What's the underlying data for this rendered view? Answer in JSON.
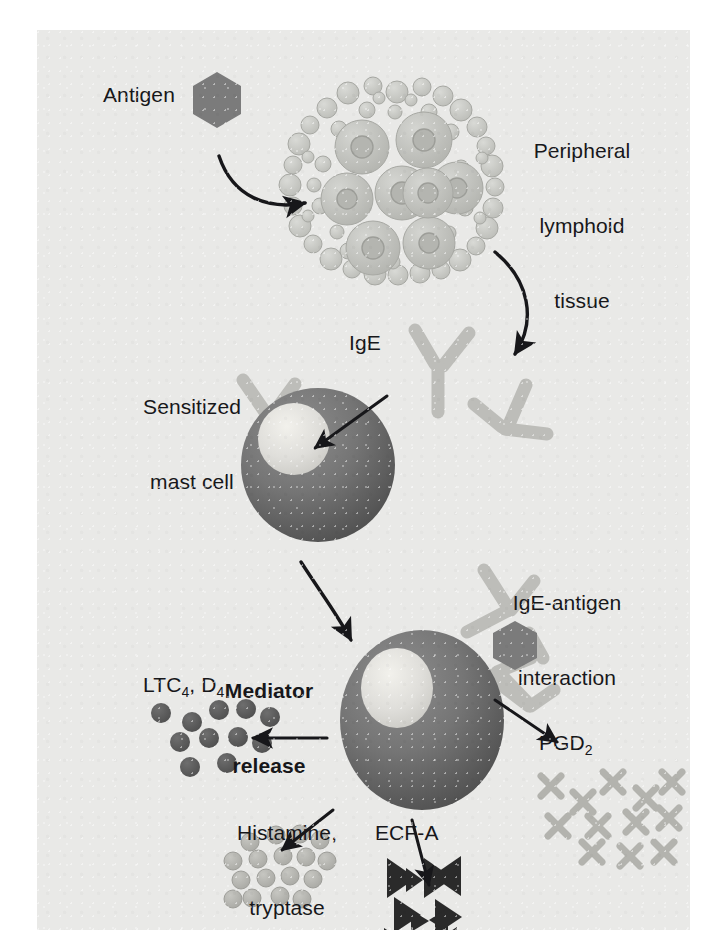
{
  "figure": {
    "type": "biological-pathway-diagram",
    "background_color": "#e9e9e7",
    "ink_color": "#17171a"
  },
  "labels": {
    "antigen": "Antigen",
    "peripheral_lymphoid_tissue_line1": "Peripheral",
    "peripheral_lymphoid_tissue_line2": "lymphoid",
    "peripheral_lymphoid_tissue_line3": "tissue",
    "ige": "IgE",
    "sensitized_mast_cell_line1": "Sensitized",
    "sensitized_mast_cell_line2": "mast cell",
    "ige_antigen_interaction_line1": "IgE-antigen",
    "ige_antigen_interaction_line2": "interaction",
    "mediator_release_line1": "Mediator",
    "mediator_release_line2": "release",
    "ltc_prefix": "LTC",
    "ltc_sub": "4",
    "ltc_mid": ", D",
    "ltc_sub2": "4",
    "histamine_line1": "Histamine,",
    "histamine_line2": "tryptase",
    "ecfa": "ECF-A",
    "pgd_prefix": "PGD",
    "pgd_sub": "2"
  },
  "elements": {
    "antigen_hexagon": {
      "name": "antigen",
      "shape": "hexagon",
      "color": "#7b7b7b"
    },
    "lymphoid_cluster": {
      "name": "peripheral lymphoid tissue",
      "shape": "cell cluster",
      "color": "#c2c3bf",
      "large_cells": 8,
      "small_cells": 52
    },
    "ige_antibody": {
      "name": "IgE antibody",
      "shape": "Y-shaped",
      "color": "#bdbdb9",
      "free_count": 3
    },
    "sensitized_mast_cell": {
      "name": "sensitized mast cell",
      "shape": "circle",
      "body_color": "#6d6d6d",
      "nucleus_color": "#e2e1dc",
      "bound_ige": 3
    },
    "activated_mast_cell": {
      "name": "activated mast cell",
      "shape": "circle",
      "body_color": "#6d6d6d",
      "nucleus_color": "#e2e1dc",
      "bound_ige": 2
    },
    "ltc_granules": {
      "name": "LTC4, D4 granules",
      "shape": "dark circles",
      "color": "#5d5d5d",
      "count": 11
    },
    "histamine_granules": {
      "name": "histamine / tryptase granules",
      "shape": "light circles",
      "color": "#b7b7b2",
      "count": 17
    },
    "ecfa_triangles": {
      "name": "ECF-A particles",
      "shape": "triangles",
      "color": "#2a2a2a",
      "count": 11
    },
    "pgd_crosses": {
      "name": "PGD2 particles",
      "shape": "X crosses",
      "color": "#b3b3ae",
      "count": 12
    }
  },
  "arrows": [
    {
      "name": "antigen-to-lymphoid-tissue",
      "from": "antigen",
      "to": "peripheral lymphoid tissue",
      "style": "curved"
    },
    {
      "name": "lymphoid-tissue-to-ige",
      "from": "peripheral lymphoid tissue",
      "to": "IgE",
      "style": "curved"
    },
    {
      "name": "ige-to-mast-cell",
      "from": "IgE",
      "to": "sensitized mast cell",
      "style": "straight"
    },
    {
      "name": "mast-cell-to-activated-mast-cell",
      "from": "sensitized mast cell",
      "to": "activated mast cell",
      "style": "curved"
    },
    {
      "name": "release-to-ltc",
      "from": "activated mast cell",
      "to": "LTC4, D4",
      "style": "straight"
    },
    {
      "name": "release-to-histamine",
      "from": "activated mast cell",
      "to": "Histamine, tryptase",
      "style": "straight"
    },
    {
      "name": "release-to-ecfa",
      "from": "activated mast cell",
      "to": "ECF-A",
      "style": "straight"
    },
    {
      "name": "release-to-pgd",
      "from": "activated mast cell",
      "to": "PGD2",
      "style": "straight"
    }
  ]
}
